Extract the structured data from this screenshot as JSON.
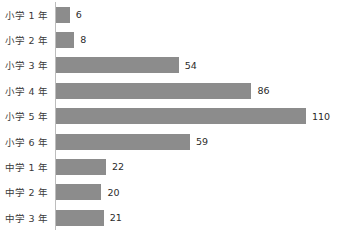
{
  "chart_data": {
    "type": "bar",
    "orientation": "horizontal",
    "title": "",
    "xlabel": "",
    "ylabel": "",
    "grid": false,
    "legend": null,
    "xlim": [
      0,
      110
    ],
    "categories": [
      "小学 1 年",
      "小学 2 年",
      "小学 3 年",
      "小学 4 年",
      "小学 5 年",
      "小学 6 年",
      "中学 1 年",
      "中学 2 年",
      "中学 3 年"
    ],
    "values": [
      6,
      8,
      54,
      86,
      110,
      59,
      22,
      20,
      21
    ],
    "value_labels": [
      "6",
      "8",
      "54",
      "86",
      "110",
      "59",
      "22",
      "20",
      "21"
    ],
    "bar_color": "#8c8c8c",
    "axis_color": "#bdbdbd",
    "label_color": "#3a3a3a",
    "value_color": "#2b2b2b"
  },
  "caption": ""
}
